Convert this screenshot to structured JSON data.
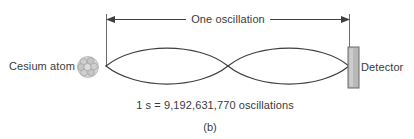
{
  "figure": {
    "panel_label": "(b)",
    "caption_equation": "1 s = 9,192,631,770 oscillations",
    "span_label": "One oscillation",
    "source_label": "Cesium atom",
    "target_label": "Detector",
    "icons": {
      "atom": "cesium-atom-icon",
      "detector": "detector-bar-icon",
      "arrow": "double-headed-arrow-icon",
      "wave": "standing-wave-icon"
    },
    "colors": {
      "stroke": "#3f3f3f",
      "text": "#3a3a3a",
      "detector_fill": "#b8b8b8",
      "detector_stroke": "#6b6b6b",
      "atom_fill": "#c9c9c9",
      "atom_stroke": "#9a9a9a",
      "background": "#ffffff"
    },
    "geometry": {
      "wave_start_x": 106,
      "wave_end_x": 349,
      "wave_node_x": 228,
      "wave_axis_y": 66,
      "wave_amplitude": 22,
      "arrow_y": 19,
      "detector_x": 348,
      "detector_y": 47,
      "detector_width": 11,
      "detector_height": 41,
      "atom_cx": 88,
      "atom_cy": 67
    }
  }
}
